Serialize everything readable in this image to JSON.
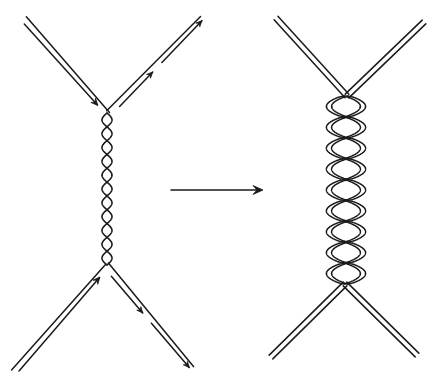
{
  "diagram": {
    "type": "feynman-to-string",
    "ink_color": "#1a1a1a",
    "background": "#ffffff",
    "left": {
      "label": "quark-gluon exchange",
      "upper_vertex": [
        109,
        113
      ],
      "lower_vertex": [
        106,
        265
      ],
      "legs": [
        {
          "name": "top-left-leg",
          "from": [
            24,
            19
          ],
          "to": [
            109,
            113
          ],
          "arrow": "in"
        },
        {
          "name": "top-right-leg",
          "from": [
            109,
            113
          ],
          "to": [
            201,
            17
          ],
          "arrow": "out"
        },
        {
          "name": "bottom-left-leg",
          "from": [
            14,
            372
          ],
          "to": [
            106,
            265
          ],
          "arrow": "in"
        },
        {
          "name": "bottom-right-leg",
          "from": [
            106,
            265
          ],
          "to": [
            193,
            367
          ],
          "arrow": "out"
        }
      ],
      "gluon": {
        "x": 107,
        "y_start": 113,
        "y_end": 265,
        "twists": 11,
        "amplitude": 5
      }
    },
    "transition_arrow": {
      "from": [
        171,
        190
      ],
      "to": [
        263,
        190
      ],
      "direction": "right"
    },
    "right": {
      "label": "braided double-line string",
      "upper_crossing": [
        347,
        96
      ],
      "lower_crossing": [
        345,
        284
      ],
      "legs": [
        {
          "name": "top-left-leg",
          "from": [
            276,
            18
          ],
          "to": [
            347,
            96
          ]
        },
        {
          "name": "top-right-leg",
          "from": [
            347,
            96
          ],
          "to": [
            424,
            22
          ]
        },
        {
          "name": "bottom-left-leg",
          "from": [
            345,
            284
          ],
          "to": [
            271,
            357
          ]
        },
        {
          "name": "bottom-right-leg",
          "from": [
            345,
            284
          ],
          "to": [
            417,
            355
          ]
        }
      ],
      "braid": {
        "x": 346,
        "y_start": 96,
        "y_end": 284,
        "lobes": 9,
        "half_width": 17
      }
    }
  }
}
